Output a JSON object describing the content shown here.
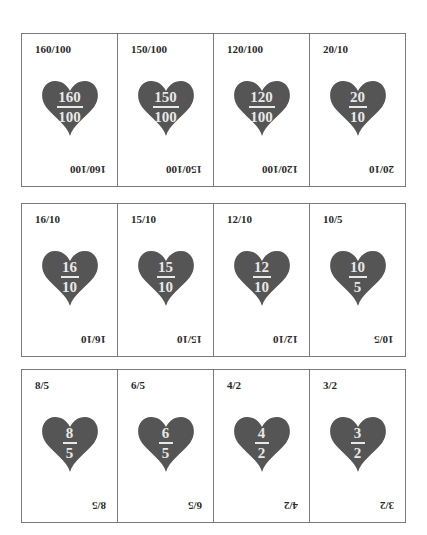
{
  "colors": {
    "heart": "#555555",
    "fraction_text": "#e8e8e8",
    "border": "#7a7a7a",
    "label": "#2a2a2a"
  },
  "rows": [
    {
      "cards": [
        {
          "label": "160/100",
          "numerator": "160",
          "denominator": "100"
        },
        {
          "label": "150/100",
          "numerator": "150",
          "denominator": "100"
        },
        {
          "label": "120/100",
          "numerator": "120",
          "denominator": "100"
        },
        {
          "label": "20/10",
          "numerator": "20",
          "denominator": "10"
        }
      ]
    },
    {
      "cards": [
        {
          "label": "16/10",
          "numerator": "16",
          "denominator": "10"
        },
        {
          "label": "15/10",
          "numerator": "15",
          "denominator": "10"
        },
        {
          "label": "12/10",
          "numerator": "12",
          "denominator": "10"
        },
        {
          "label": "10/5",
          "numerator": "10",
          "denominator": "5"
        }
      ]
    },
    {
      "cards": [
        {
          "label": "8/5",
          "numerator": "8",
          "denominator": "5"
        },
        {
          "label": "6/5",
          "numerator": "6",
          "denominator": "5"
        },
        {
          "label": "4/2",
          "numerator": "4",
          "denominator": "2"
        },
        {
          "label": "3/2",
          "numerator": "3",
          "denominator": "2"
        }
      ]
    }
  ]
}
